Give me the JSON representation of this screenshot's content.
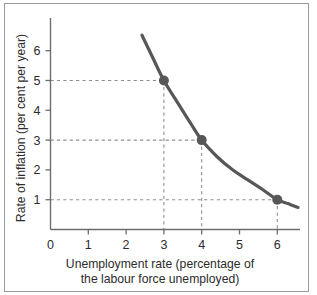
{
  "chart_data": {
    "type": "line",
    "title": "",
    "xlabel": "Unemployment rate (percentage of the labour force unemployed)",
    "xlabel_line1": "Unemployment rate (percentage of",
    "xlabel_line2": "the labour force unemployed)",
    "ylabel": "Rate of inflation (per cent per year)",
    "xlim": [
      0,
      6.6
    ],
    "ylim": [
      0,
      6.8
    ],
    "xticks": [
      0,
      1,
      2,
      3,
      4,
      5,
      6
    ],
    "xticklabels": [
      "0",
      "1",
      "2",
      "3",
      "4",
      "5",
      "6"
    ],
    "yticks": [
      1,
      2,
      3,
      4,
      5,
      6
    ],
    "yticklabels": [
      "1",
      "2",
      "3",
      "4",
      "5",
      "6"
    ],
    "grid": false,
    "legend": null,
    "series": [
      {
        "name": "Phillips curve",
        "color": "#575757",
        "x": [
          2.42,
          2.7,
          3.0,
          3.4,
          3.7,
          4.0,
          4.4,
          4.8,
          5.2,
          5.6,
          6.0,
          6.3,
          6.55
        ],
        "y": [
          6.52,
          5.78,
          5.0,
          4.18,
          3.58,
          3.0,
          2.45,
          2.02,
          1.68,
          1.35,
          1.0,
          0.86,
          0.74
        ]
      }
    ],
    "marked_points": [
      {
        "label": "A",
        "x": 3,
        "y": 5
      },
      {
        "label": "B",
        "x": 4,
        "y": 3
      },
      {
        "label": "C",
        "x": 6,
        "y": 1
      }
    ],
    "guide_lines": {
      "style": "dashed",
      "color": "#8f8f8f",
      "horizontal_at_y": [
        5,
        3,
        1
      ],
      "vertical_at_x": [
        3,
        4,
        6
      ]
    },
    "colors": {
      "curve": "#575757",
      "marker": "#575757",
      "axis": "#6d6d6d",
      "guide": "#8f8f8f",
      "text": "#2b2b2b",
      "frame": "#9a9a9a",
      "background": "#ffffff"
    }
  }
}
